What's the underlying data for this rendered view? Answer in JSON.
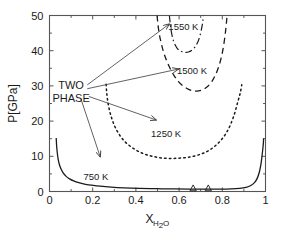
{
  "chart_data": {
    "type": "line",
    "title": "",
    "xlabel": "X_H2O",
    "xlabel_main": "X",
    "xlabel_sub": "H",
    "xlabel_sub2": "2",
    "xlabel_sub3": "O",
    "ylabel": "P[GPa]",
    "xlim": [
      0,
      1
    ],
    "ylim": [
      0,
      50
    ],
    "grid": false,
    "legend_position": "inline-annotations",
    "xticks": [
      0,
      0.2,
      0.4,
      0.6,
      0.8,
      1
    ],
    "xtick_labels": [
      "0",
      "0.2",
      "0.4",
      "0.6",
      "0.8",
      "1"
    ],
    "yticks": [
      0,
      10,
      20,
      30,
      40,
      50
    ],
    "ytick_labels": [
      "0",
      "10",
      "20",
      "30",
      "40",
      "50"
    ],
    "x_minor_ticks": [
      0.1,
      0.3,
      0.5,
      0.7,
      0.9
    ],
    "y_minor_ticks": [
      5,
      15,
      25,
      35,
      45
    ],
    "series": [
      {
        "name": "1550 K",
        "label": "1550 K",
        "style": "dash-dot",
        "label_x": 0.62,
        "label_y": 47.0,
        "points": [
          [
            0.555,
            50.0
          ],
          [
            0.558,
            48.2
          ],
          [
            0.562,
            46.2
          ],
          [
            0.567,
            44.4
          ],
          [
            0.574,
            42.8
          ],
          [
            0.582,
            41.6
          ],
          [
            0.592,
            40.6
          ],
          [
            0.604,
            40.0
          ],
          [
            0.618,
            39.6
          ],
          [
            0.632,
            39.5
          ],
          [
            0.646,
            39.7
          ],
          [
            0.66,
            40.2
          ],
          [
            0.673,
            41.0
          ],
          [
            0.684,
            42.1
          ],
          [
            0.693,
            43.5
          ],
          [
            0.7,
            45.1
          ],
          [
            0.706,
            46.9
          ],
          [
            0.71,
            48.5
          ],
          [
            0.713,
            50.0
          ]
        ]
      },
      {
        "name": "1500 K",
        "label": "1500 K",
        "style": "dashed",
        "label_x": 0.66,
        "label_y": 34.5,
        "points": [
          [
            0.498,
            50.0
          ],
          [
            0.502,
            47.5
          ],
          [
            0.508,
            44.8
          ],
          [
            0.517,
            42.2
          ],
          [
            0.528,
            39.6
          ],
          [
            0.542,
            37.2
          ],
          [
            0.558,
            35.0
          ],
          [
            0.576,
            33.0
          ],
          [
            0.596,
            31.3
          ],
          [
            0.618,
            30.0
          ],
          [
            0.642,
            29.1
          ],
          [
            0.666,
            28.6
          ],
          [
            0.69,
            28.6
          ],
          [
            0.712,
            29.0
          ],
          [
            0.733,
            29.9
          ],
          [
            0.752,
            31.3
          ],
          [
            0.769,
            33.2
          ],
          [
            0.784,
            35.6
          ],
          [
            0.797,
            38.5
          ],
          [
            0.807,
            41.8
          ],
          [
            0.815,
            45.5
          ],
          [
            0.82,
            48.5
          ],
          [
            0.822,
            50.0
          ]
        ]
      },
      {
        "name": "1250 K",
        "label": "1250 K",
        "style": "dotted",
        "label_x": 0.54,
        "label_y": 16.5,
        "points": [
          [
            0.262,
            30.5
          ],
          [
            0.265,
            28.0
          ],
          [
            0.27,
            25.5
          ],
          [
            0.278,
            23.0
          ],
          [
            0.288,
            20.8
          ],
          [
            0.3,
            18.8
          ],
          [
            0.315,
            17.0
          ],
          [
            0.333,
            15.3
          ],
          [
            0.355,
            13.8
          ],
          [
            0.382,
            12.5
          ],
          [
            0.412,
            11.4
          ],
          [
            0.446,
            10.5
          ],
          [
            0.484,
            9.9
          ],
          [
            0.524,
            9.5
          ],
          [
            0.566,
            9.4
          ],
          [
            0.608,
            9.5
          ],
          [
            0.65,
            9.8
          ],
          [
            0.69,
            10.4
          ],
          [
            0.727,
            11.3
          ],
          [
            0.76,
            12.6
          ],
          [
            0.79,
            14.3
          ],
          [
            0.816,
            16.4
          ],
          [
            0.838,
            19.0
          ],
          [
            0.856,
            22.0
          ],
          [
            0.871,
            25.3
          ],
          [
            0.883,
            28.0
          ],
          [
            0.89,
            30.3
          ]
        ]
      },
      {
        "name": "750 K",
        "label": "750 K",
        "style": "solid",
        "label_x": 0.215,
        "label_y": 4.3,
        "points": [
          [
            0.031,
            15.2
          ],
          [
            0.033,
            13.0
          ],
          [
            0.036,
            11.0
          ],
          [
            0.04,
            9.2
          ],
          [
            0.046,
            7.6
          ],
          [
            0.054,
            6.3
          ],
          [
            0.064,
            5.2
          ],
          [
            0.077,
            4.3
          ],
          [
            0.093,
            3.6
          ],
          [
            0.112,
            3.0
          ],
          [
            0.135,
            2.5
          ],
          [
            0.162,
            2.1
          ],
          [
            0.195,
            1.8
          ],
          [
            0.235,
            1.5
          ],
          [
            0.285,
            1.25
          ],
          [
            0.345,
            1.05
          ],
          [
            0.415,
            0.9
          ],
          [
            0.495,
            0.8
          ],
          [
            0.575,
            0.72
          ],
          [
            0.65,
            0.68
          ],
          [
            0.72,
            0.66
          ],
          [
            0.785,
            0.68
          ],
          [
            0.84,
            0.75
          ],
          [
            0.88,
            0.9
          ],
          [
            0.91,
            1.2
          ],
          [
            0.932,
            1.7
          ],
          [
            0.95,
            2.6
          ],
          [
            0.962,
            3.8
          ],
          [
            0.971,
            5.4
          ],
          [
            0.978,
            7.4
          ],
          [
            0.983,
            9.6
          ],
          [
            0.987,
            11.8
          ],
          [
            0.99,
            13.6
          ],
          [
            0.991,
            15.1
          ]
        ]
      }
    ],
    "markers": [
      {
        "name": "triangle-marker-1",
        "x": 0.665,
        "y": 0.9,
        "shape": "triangle-up"
      },
      {
        "name": "triangle-marker-2",
        "x": 0.735,
        "y": 0.9,
        "shape": "triangle-up"
      }
    ],
    "annotations": [
      {
        "name": "two-phase-label",
        "line1": "TWO",
        "line2": "PHASE",
        "x": 0.1,
        "y": 30.0
      }
    ],
    "leader_lines": [
      {
        "name": "leader-to-1550",
        "from": [
          0.175,
          30.3
        ],
        "to": [
          0.555,
          47.6
        ]
      },
      {
        "name": "leader-to-1500",
        "from": [
          0.175,
          29.2
        ],
        "to": [
          0.598,
          34.8
        ]
      },
      {
        "name": "leader-to-1250",
        "from": [
          0.182,
          27.0
        ],
        "to": [
          0.495,
          20.3
        ]
      },
      {
        "name": "leader-to-750",
        "from": [
          0.145,
          26.4
        ],
        "to": [
          0.235,
          9.8
        ]
      }
    ],
    "colors": {
      "curve": "#1a1a1a",
      "frame": "#555555",
      "text": "#1a1a1a",
      "background": "#ffffff"
    }
  }
}
